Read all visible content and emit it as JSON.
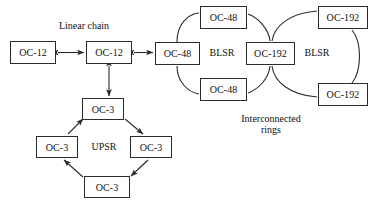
{
  "diagram": {
    "background": "#ffffff",
    "line_color": "#2b2b2b",
    "text_color": "#111111",
    "nodes": [
      {
        "id": "chain-left",
        "label": "OC-12",
        "x": 10,
        "y": 41,
        "w": 46,
        "h": 23
      },
      {
        "id": "chain-mid",
        "label": "OC-12",
        "x": 86,
        "y": 41,
        "w": 46,
        "h": 23
      },
      {
        "id": "blsr1-left",
        "label": "OC-48",
        "x": 155,
        "y": 42,
        "w": 45,
        "h": 23
      },
      {
        "id": "blsr1-top",
        "label": "OC-48",
        "x": 200,
        "y": 6,
        "w": 47,
        "h": 23
      },
      {
        "id": "blsr1-bottom",
        "label": "OC-48",
        "x": 200,
        "y": 78,
        "w": 47,
        "h": 23
      },
      {
        "id": "blsr-shared",
        "label": "OC-192",
        "x": 246,
        "y": 42,
        "w": 49,
        "h": 23
      },
      {
        "id": "blsr2-top",
        "label": "OC-192",
        "x": 318,
        "y": 6,
        "w": 50,
        "h": 23
      },
      {
        "id": "blsr2-bottom",
        "label": "OC-192",
        "x": 318,
        "y": 83,
        "w": 50,
        "h": 23
      },
      {
        "id": "upsr-top",
        "label": "OC-3",
        "x": 82,
        "y": 98,
        "w": 42,
        "h": 22
      },
      {
        "id": "upsr-left",
        "label": "OC-3",
        "x": 36,
        "y": 136,
        "w": 42,
        "h": 22
      },
      {
        "id": "upsr-right",
        "label": "OC-3",
        "x": 130,
        "y": 136,
        "w": 42,
        "h": 22
      },
      {
        "id": "upsr-bottom",
        "label": "OC-3",
        "x": 84,
        "y": 176,
        "w": 46,
        "h": 22
      }
    ],
    "captions": [
      {
        "id": "linear-chain",
        "text": "Linear chain",
        "x": 48,
        "y": 20,
        "w": 72,
        "align": "center",
        "lines": 1
      },
      {
        "id": "blsr-left-label",
        "text": "BLSR",
        "x": 202,
        "y": 47,
        "w": 40,
        "align": "center",
        "lines": 1
      },
      {
        "id": "blsr-right-label",
        "text": "BLSR",
        "x": 297,
        "y": 47,
        "w": 40,
        "align": "center",
        "lines": 1
      },
      {
        "id": "upsr-label",
        "text": "UPSR",
        "x": 83,
        "y": 141,
        "w": 42,
        "align": "center",
        "lines": 1
      },
      {
        "id": "interconnected-line1",
        "text": "Interconnected",
        "x": 228,
        "y": 113,
        "w": 86,
        "align": "center",
        "lines": 1
      },
      {
        "id": "interconnected-line2",
        "text": "rings",
        "x": 228,
        "y": 124,
        "w": 86,
        "align": "center",
        "lines": 1
      }
    ],
    "links": {
      "bidirectional_arrows": [
        {
          "id": "chain-left-to-mid",
          "from": "chain-left",
          "to": "chain-mid"
        },
        {
          "id": "chain-mid-to-blsr",
          "from": "chain-mid",
          "to": "blsr1-left"
        },
        {
          "id": "chain-mid-to-upsr",
          "from": "chain-mid",
          "to": "upsr-top"
        }
      ],
      "directed_arrows": [
        {
          "id": "upsr-left-to-top",
          "from": "upsr-left",
          "to": "upsr-top"
        },
        {
          "id": "upsr-top-to-right",
          "from": "upsr-top",
          "to": "upsr-right"
        },
        {
          "id": "upsr-right-to-bottom",
          "from": "upsr-right",
          "to": "upsr-bottom"
        },
        {
          "id": "upsr-bottom-to-left",
          "from": "upsr-bottom",
          "to": "upsr-left"
        }
      ],
      "ring_curves": [
        {
          "id": "blsr1-left-to-top",
          "from": "blsr1-left",
          "to": "blsr1-top"
        },
        {
          "id": "blsr1-top-to-shared",
          "from": "blsr1-top",
          "to": "blsr-shared"
        },
        {
          "id": "blsr1-left-to-bottom",
          "from": "blsr1-left",
          "to": "blsr1-bottom"
        },
        {
          "id": "blsr1-bottom-to-shared",
          "from": "blsr1-bottom",
          "to": "blsr-shared"
        },
        {
          "id": "blsr2-shared-to-top",
          "from": "blsr-shared",
          "to": "blsr2-top"
        },
        {
          "id": "blsr2-shared-to-bottom",
          "from": "blsr-shared",
          "to": "blsr2-bottom"
        },
        {
          "id": "blsr2-top-to-bottom",
          "from": "blsr2-top",
          "to": "blsr2-bottom"
        }
      ]
    }
  }
}
